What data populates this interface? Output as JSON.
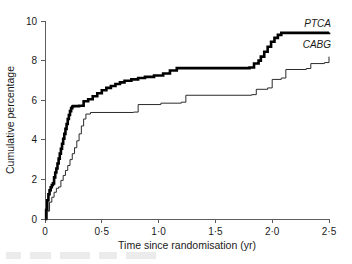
{
  "chart_data": {
    "type": "line",
    "title": "",
    "subtitle": "",
    "xlabel": "Time since randomisation (yr)",
    "ylabel": "Cumulative percentage",
    "xlim": [
      0,
      2.5
    ],
    "ylim": [
      0,
      10
    ],
    "grid": false,
    "legend_position": "inline-right",
    "step_style": "post",
    "x_tick_values": [
      0,
      0.5,
      1.0,
      1.5,
      2.0,
      2.5
    ],
    "x_tick_labels": [
      "0",
      "0·5",
      "1·0",
      "1·5",
      "2·0",
      "2·5"
    ],
    "y_tick_values": [
      0,
      2,
      4,
      6,
      8,
      10
    ],
    "y_tick_labels": [
      "0",
      "2",
      "4",
      "6",
      "8",
      "10"
    ],
    "series": [
      {
        "name": "PTCA",
        "label": "PTCA",
        "color": "#000000",
        "line_width": 2.6,
        "label_x": 2.52,
        "label_y": 9.72,
        "x": [
          0.0,
          0.01,
          0.02,
          0.03,
          0.04,
          0.05,
          0.06,
          0.07,
          0.08,
          0.09,
          0.1,
          0.11,
          0.12,
          0.13,
          0.14,
          0.15,
          0.16,
          0.17,
          0.18,
          0.19,
          0.2,
          0.21,
          0.22,
          0.23,
          0.24,
          0.25,
          0.3,
          0.34,
          0.38,
          0.42,
          0.46,
          0.5,
          0.54,
          0.58,
          0.62,
          0.66,
          0.7,
          0.76,
          0.82,
          0.88,
          0.96,
          1.04,
          1.1,
          1.16,
          1.8,
          1.84,
          1.88,
          1.9,
          1.93,
          1.96,
          1.99,
          2.02,
          2.05,
          2.08,
          2.5
        ],
        "y": [
          0.0,
          0.45,
          0.95,
          1.25,
          1.45,
          1.6,
          1.72,
          1.8,
          2.1,
          2.35,
          2.55,
          2.8,
          3.05,
          3.3,
          3.55,
          3.8,
          4.05,
          4.3,
          4.55,
          4.8,
          5.05,
          5.25,
          5.45,
          5.6,
          5.68,
          5.7,
          5.72,
          5.95,
          6.05,
          6.2,
          6.35,
          6.5,
          6.62,
          6.72,
          6.82,
          6.9,
          6.98,
          7.05,
          7.12,
          7.18,
          7.25,
          7.35,
          7.5,
          7.62,
          7.65,
          7.85,
          8.0,
          8.2,
          8.45,
          8.7,
          8.95,
          9.15,
          9.3,
          9.4,
          9.42
        ]
      },
      {
        "name": "CABG",
        "label": "CABG",
        "color": "#2b2b2b",
        "line_width": 1.0,
        "label_x": 2.52,
        "label_y": 8.62,
        "x": [
          0.0,
          0.02,
          0.04,
          0.06,
          0.08,
          0.1,
          0.12,
          0.14,
          0.16,
          0.18,
          0.2,
          0.22,
          0.24,
          0.26,
          0.28,
          0.3,
          0.32,
          0.34,
          0.36,
          0.4,
          0.78,
          0.82,
          1.02,
          1.2,
          1.24,
          1.82,
          1.86,
          1.96,
          2.0,
          2.08,
          2.12,
          2.3,
          2.34,
          2.46,
          2.5
        ],
        "y": [
          0.0,
          0.4,
          0.85,
          1.1,
          1.35,
          1.55,
          1.62,
          1.95,
          2.2,
          2.45,
          2.7,
          3.0,
          3.3,
          3.6,
          3.95,
          4.3,
          4.7,
          5.05,
          5.3,
          5.38,
          5.4,
          5.78,
          5.85,
          5.9,
          6.25,
          6.28,
          6.55,
          6.62,
          7.05,
          7.12,
          7.55,
          7.6,
          7.85,
          7.9,
          8.2
        ]
      }
    ]
  }
}
